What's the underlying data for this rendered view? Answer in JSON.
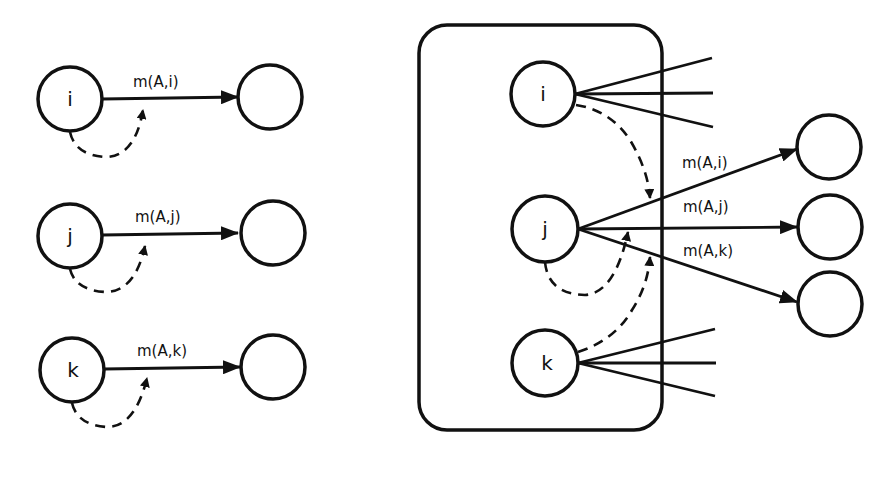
{
  "left_panel": {
    "rows": [
      {
        "node": "i",
        "edge_label": "m(A,i)"
      },
      {
        "node": "j",
        "edge_label": "m(A,j)"
      },
      {
        "node": "k",
        "edge_label": "m(A,k)"
      }
    ]
  },
  "right_panel": {
    "group_nodes": [
      "i",
      "j",
      "k"
    ],
    "edge_labels": [
      "m(A,i)",
      "m(A,j)",
      "m(A,k)"
    ]
  },
  "colors": {
    "ink": "#111111",
    "background": "#ffffff"
  }
}
